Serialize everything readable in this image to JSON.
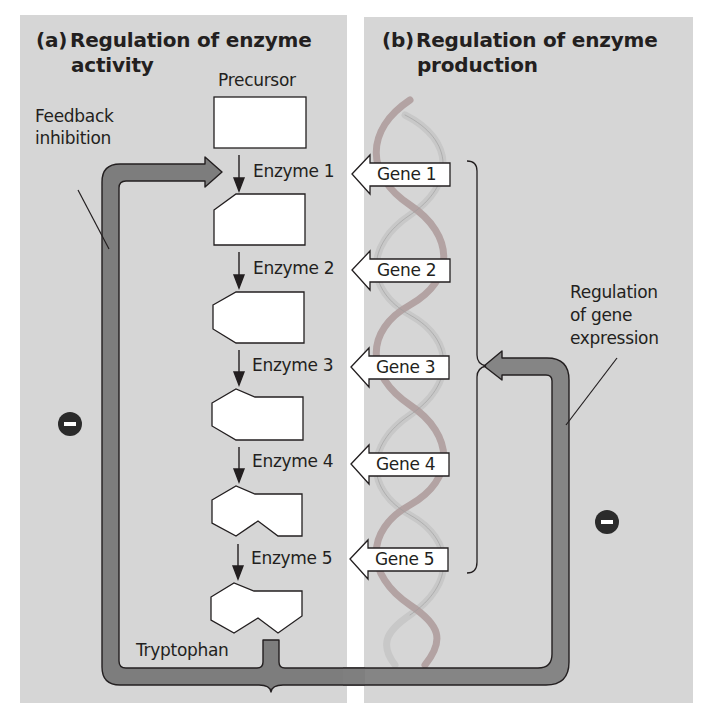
{
  "panel_a": {
    "tag": "(a)",
    "title_line1": "Regulation of enzyme",
    "title_line2": "activity",
    "precursor_label": "Precursor",
    "feedback_label_line1": "Feedback",
    "feedback_label_line2": "inhibition",
    "product_label": "Tryptophan",
    "inhibit_symbol": "minus-icon",
    "enzymes": [
      {
        "label": "Enzyme 1"
      },
      {
        "label": "Enzyme 2"
      },
      {
        "label": "Enzyme 3"
      },
      {
        "label": "Enzyme 4"
      },
      {
        "label": "Enzyme 5"
      }
    ]
  },
  "panel_b": {
    "tag": "(b)",
    "title_line1": "Regulation of enzyme",
    "title_line2": "production",
    "regulation_label_line1": "Regulation",
    "regulation_label_line2": "of gene",
    "regulation_label_line3": "expression",
    "inhibit_symbol": "minus-icon",
    "genes": [
      {
        "label": "Gene 1"
      },
      {
        "label": "Gene 2"
      },
      {
        "label": "Gene 3"
      },
      {
        "label": "Gene 4"
      },
      {
        "label": "Gene 5"
      }
    ]
  },
  "colors": {
    "panel_bg": "#d6d6d6",
    "arrow_fill": "#7d7d7d",
    "outline": "#231f20",
    "dna_strand_a": "#b9a9a9",
    "dna_strand_b": "#c9c9c9"
  }
}
